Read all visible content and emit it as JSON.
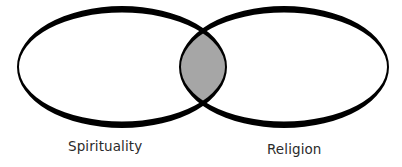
{
  "diagram": {
    "type": "venn",
    "sets": [
      {
        "label": "Spirituality"
      },
      {
        "label": "Religion"
      }
    ],
    "overlap": {
      "label": ""
    },
    "colors": {
      "outline": "#000000",
      "overlap_fill": "#a6a6a6",
      "set_fill": "#ffffff",
      "label_text": "#2b2b2b"
    }
  }
}
